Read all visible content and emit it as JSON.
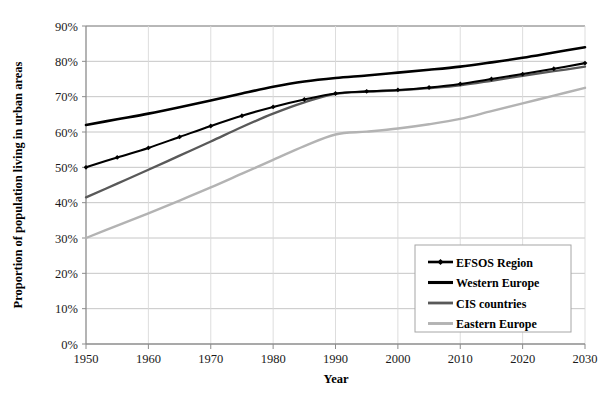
{
  "chart_data": {
    "type": "line",
    "title": "",
    "xlabel": "Year",
    "ylabel": "Proportion of population living in urban areas",
    "xlim": [
      1950,
      2030
    ],
    "ylim": [
      0,
      90
    ],
    "xtick_labels": [
      "1950",
      "1960",
      "1970",
      "1980",
      "1990",
      "2000",
      "2010",
      "2020",
      "2030"
    ],
    "xticks": [
      1950,
      1960,
      1970,
      1980,
      1990,
      2000,
      2010,
      2020,
      2030
    ],
    "ytick_labels": [
      "0%",
      "10%",
      "20%",
      "30%",
      "40%",
      "50%",
      "60%",
      "70%",
      "80%",
      "90%"
    ],
    "yticks": [
      0,
      10,
      20,
      30,
      40,
      50,
      60,
      70,
      80,
      90
    ],
    "grid": true,
    "grid_axis": "y",
    "legend_position": "bottom-right",
    "x": [
      1950,
      1955,
      1960,
      1965,
      1970,
      1975,
      1980,
      1985,
      1990,
      1995,
      2000,
      2005,
      2010,
      2015,
      2020,
      2025,
      2030
    ],
    "series": [
      {
        "name": "EFSOS Region",
        "color": "#000000",
        "marker": "diamond",
        "width": 2.1,
        "values": [
          50.0,
          52.8,
          55.5,
          58.6,
          61.7,
          64.6,
          67.1,
          69.2,
          70.9,
          71.5,
          71.9,
          72.6,
          73.6,
          75.0,
          76.4,
          77.9,
          79.5
        ]
      },
      {
        "name": "Western Europe",
        "color": "#000000",
        "marker": "none",
        "width": 2.6,
        "values": [
          62.0,
          63.6,
          65.2,
          67.0,
          68.9,
          70.9,
          72.8,
          74.3,
          75.3,
          76.0,
          76.8,
          77.6,
          78.5,
          79.7,
          81.0,
          82.5,
          84.0
        ]
      },
      {
        "name": "CIS countries",
        "color": "#595959",
        "marker": "none",
        "width": 2.3,
        "values": [
          41.5,
          45.4,
          49.3,
          53.3,
          57.3,
          61.4,
          65.2,
          68.4,
          70.8,
          71.4,
          71.8,
          72.4,
          73.2,
          74.5,
          75.9,
          77.2,
          78.5
        ]
      },
      {
        "name": "Eastern Europe",
        "color": "#b3b3b3",
        "marker": "none",
        "width": 2.4,
        "values": [
          30.0,
          33.5,
          37.0,
          40.6,
          44.3,
          48.2,
          52.1,
          56.0,
          59.3,
          60.1,
          61.0,
          62.2,
          63.7,
          65.9,
          68.1,
          70.3,
          72.5
        ]
      }
    ],
    "colors": {
      "axis": "#808080",
      "grid": "#bfbfbf",
      "text": "#1a1a1a",
      "background": "#ffffff",
      "legend_border": "#a6a6a6"
    }
  },
  "legend": {
    "items": [
      {
        "label": "EFSOS Region"
      },
      {
        "label": "Western Europe"
      },
      {
        "label": "CIS countries"
      },
      {
        "label": "Eastern Europe"
      }
    ]
  },
  "artifacts": {
    "top_strip": "                                                                                 "
  }
}
